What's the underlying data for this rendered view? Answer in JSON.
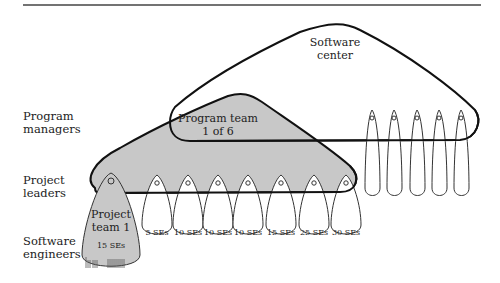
{
  "row_labels": {
    "program_managers": [
      "Program",
      "managers"
    ],
    "project_leaders": [
      "Project",
      "leaders"
    ],
    "software_engineers": [
      "Software",
      "engineers"
    ]
  },
  "software_center": {
    "label_line1": "Software",
    "label_line2": "center"
  },
  "program_team": {
    "label_line1": "Program team",
    "label_line2": "1 of 6"
  },
  "project_team_1": {
    "label_line1": "Project",
    "label_line2": "team 1",
    "size": "15 SEs"
  },
  "project_teams": [
    {
      "size": "5 SEs"
    },
    {
      "size": "10 SEs"
    },
    {
      "size": "10 SEs"
    },
    {
      "size": "10 SEs"
    },
    {
      "size": "15 SEs"
    },
    {
      "size": "25 SEs"
    },
    {
      "size": "30 SEs"
    }
  ],
  "other_program_teams_count": 5,
  "colors": {
    "fill_gray": "#c8c8c8",
    "stroke": "#111111",
    "rule": "#444444"
  }
}
